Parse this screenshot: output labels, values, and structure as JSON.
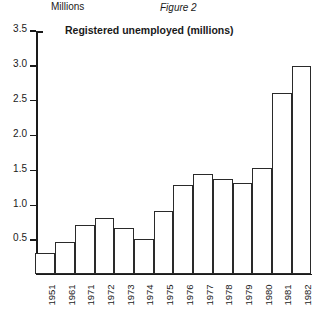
{
  "figure": {
    "caption": "Figure 2",
    "title": "Registered unemployed (millions)",
    "y_axis_unit_label": "Millions"
  },
  "chart_data": {
    "type": "bar",
    "title": "Registered unemployed (millions)",
    "subtitle": "Figure 2",
    "xlabel": "",
    "ylabel": "Millions",
    "ylim": [
      0,
      3.5
    ],
    "yticks": [
      0.5,
      1.0,
      1.5,
      2.0,
      2.5,
      3.0,
      3.5
    ],
    "ytick_labels": [
      "0.5",
      "1.0",
      "1.5",
      "2.0",
      "2.5",
      "3.0",
      "3.5"
    ],
    "grid": false,
    "legend": null,
    "bar_facecolor": "#ffffff",
    "bar_edgecolor": "#2a2a2a",
    "categories": [
      "1951",
      "1961",
      "1971",
      "1972",
      "1973",
      "1974",
      "1975",
      "1976",
      "1977",
      "1978",
      "1979",
      "1980",
      "1981",
      "1982"
    ],
    "values": [
      0.3,
      0.45,
      0.7,
      0.8,
      0.65,
      0.5,
      0.9,
      1.28,
      1.43,
      1.37,
      1.3,
      1.52,
      2.6,
      3.0
    ]
  }
}
